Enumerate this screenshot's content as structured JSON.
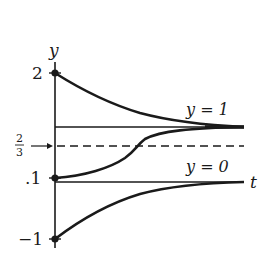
{
  "diagram": {
    "type": "solution-curves",
    "axes": {
      "y_label": "y",
      "t_label": "t"
    },
    "tick_labels": {
      "two": "2",
      "two_thirds_num": "2",
      "two_thirds_den": "3",
      "point_one": ".1",
      "minus_one": "−1"
    },
    "equilibrium_labels": {
      "upper": "y = 1",
      "lower": "y = 0"
    },
    "initial_values": [
      2,
      0.1,
      -1
    ],
    "equilibria": [
      1,
      0
    ],
    "dashed_level": "2/3",
    "colors": {
      "ink": "#1a1a1a",
      "background": "#ffffff"
    }
  }
}
